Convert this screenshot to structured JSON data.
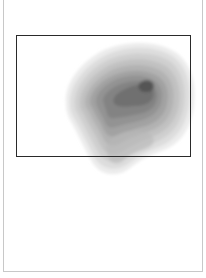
{
  "figure": {
    "type": "density-contour",
    "palette": [
      "#e9e9e9",
      "#dadada",
      "#cbcbcb",
      "#bcbcbc",
      "#adadad",
      "#9e9e9e",
      "#8f8f8f",
      "#7f7f7f",
      "#6b6b6b",
      "#4f4f4f"
    ],
    "frame_color": "#2a2a2a",
    "border_color": "#c8c8c8",
    "peak": {
      "x": 146,
      "y": 84
    }
  }
}
